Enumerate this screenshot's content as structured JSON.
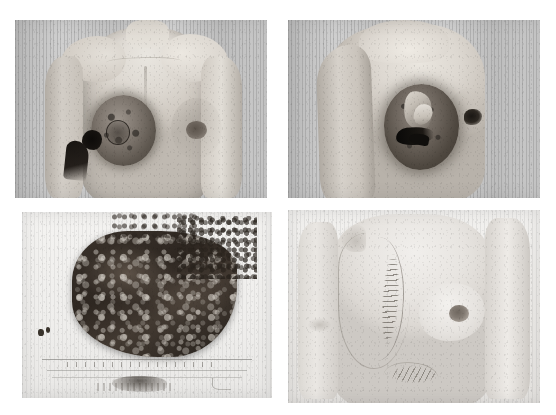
{
  "figure": {
    "layout": "2x2 photographic panels on white background",
    "background_color": "#ffffff",
    "panel_count": 4,
    "caption": "",
    "labels_visible": "none"
  },
  "panels": [
    {
      "id": "panel-frontal-preop",
      "position": "top-left",
      "name": "frontal-preoperative-view",
      "subject": "Anterior (frontal) clinical photograph of female chest",
      "description": "Frontal view showing a large darkly pigmented mass occupying the left breast with an ulcerated, necrotic area at its lateral-inferior margin. Contralateral breast and nipple appear normal.",
      "backdrop": "vertically striped curtain",
      "tone": "grayscale",
      "rect": {
        "x": 15,
        "y": 20,
        "w": 252,
        "h": 178
      },
      "features": [
        "pigmented breast mass",
        "areola outline",
        "ulcerated necrotic region",
        "normal contralateral nipple",
        "clavicle contour",
        "sternal midline"
      ]
    },
    {
      "id": "panel-oblique-preop",
      "position": "top-right",
      "name": "oblique-preoperative-view",
      "subject": "Oblique clinical photograph of same chest",
      "description": "Oblique view demonstrating the globular pigmented tumour mass of the breast with surface crusting and a linear ulcer; arm abducted to expose the lesion.",
      "backdrop": "vertically striped curtain",
      "tone": "grayscale",
      "rect": {
        "x": 288,
        "y": 20,
        "w": 252,
        "h": 178
      },
      "features": [
        "globular pigmented tumour",
        "surface crust / keratin plaque",
        "linear ulceration",
        "abducted arm",
        "contralateral nipple in profile"
      ]
    },
    {
      "id": "panel-specimen",
      "position": "bottom-left",
      "name": "gross-specimen-view",
      "subject": "Gross pathology specimen photograph",
      "description": "Resected mastectomy specimen, dark brown-black heavily pigmented tumour tissue with irregular frayed margins, photographed on a pale board beside a measuring scale with ruled tick marks.",
      "backdrop": "pale specimen board with ruled measuring scale",
      "tone": "grayscale",
      "rect": {
        "x": 22,
        "y": 212,
        "w": 250,
        "h": 186
      },
      "features": [
        "darkly pigmented resected mass",
        "irregular frayed margin",
        "two small tissue flecks",
        "ruled measuring scale",
        "scale tick marks",
        "smudged label area"
      ]
    },
    {
      "id": "panel-postop",
      "position": "bottom-right",
      "name": "postoperative-view",
      "subject": "Postoperative clinical photograph of chest",
      "description": "Post-mastectomy result showing a long oblique sutured incision over the left chest wall where the breast was removed, a healed lower abdominal/flap donor scar, and the preserved contralateral breast.",
      "backdrop": "vertically striped curtain",
      "tone": "grayscale",
      "rect": {
        "x": 288,
        "y": 210,
        "w": 252,
        "h": 193
      },
      "features": [
        "oblique sutured mastectomy incision",
        "staple / suture line",
        "flap margin outline",
        "healed lower scar",
        "preserved contralateral breast and nipple",
        "axillary fold"
      ]
    }
  ]
}
